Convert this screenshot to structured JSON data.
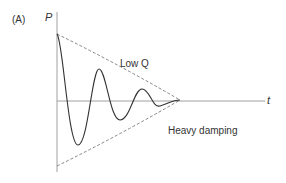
{
  "panel_label": "(A)",
  "y_axis_label": "P",
  "x_axis_label": "t",
  "annotations": {
    "low_q": "Low Q",
    "heavy_damping": "Heavy damping"
  },
  "colors": {
    "curve": "#333333",
    "envelope": "#666666",
    "axis": "#888888"
  }
}
